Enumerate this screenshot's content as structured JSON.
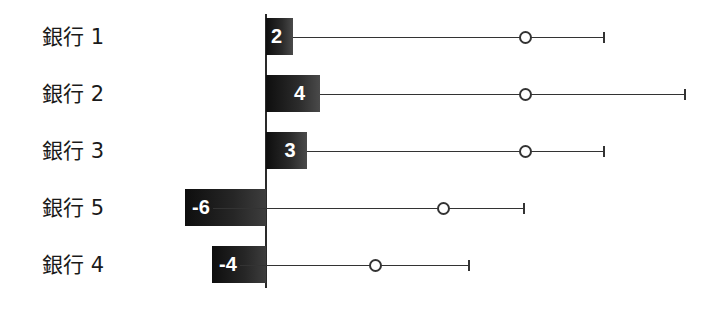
{
  "chart_data": {
    "type": "bar",
    "orientation": "horizontal",
    "title": "",
    "xlabel": "",
    "ylabel": "",
    "grid": false,
    "legend": null,
    "categories": [
      "銀行 1",
      "銀行 2",
      "銀行 3",
      "銀行 5",
      "銀行 4"
    ],
    "values": [
      2,
      4,
      3,
      -6,
      -4
    ],
    "value_labels": [
      "2",
      "4",
      "3",
      "-6",
      "-4"
    ],
    "markers": [
      19.2,
      19.2,
      19.2,
      13.1,
      8.1
    ],
    "whisker_end": [
      25,
      31,
      25,
      19.1,
      15
    ],
    "xlim": [
      -6,
      31
    ],
    "colors": {
      "bar": "#1a1a1a",
      "label": "#ffffff",
      "line": "#333333"
    }
  },
  "rows": [
    {
      "label": "銀行 1",
      "value_text": "2"
    },
    {
      "label": "銀行 2",
      "value_text": "4"
    },
    {
      "label": "銀行 3",
      "value_text": "3"
    },
    {
      "label": "銀行 5",
      "value_text": "-6"
    },
    {
      "label": "銀行 4",
      "value_text": "-4"
    }
  ]
}
